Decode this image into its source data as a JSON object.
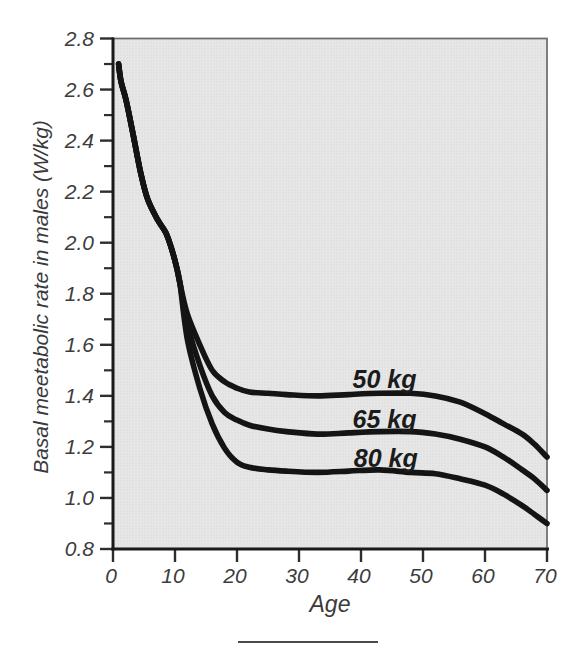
{
  "figure": {
    "background": "#ffffff",
    "caption_rule_color": "#4a4a4a"
  },
  "chart_data": {
    "type": "line",
    "title": "",
    "xlabel": "Age",
    "ylabel": "Basal meetabolic rate in males (W/kg)",
    "xlim": [
      0,
      70
    ],
    "ylim": [
      0.8,
      2.8
    ],
    "grid": false,
    "legend_position": "inline-curve-labels",
    "plot_bg": "#e7e7e7",
    "plot_dot_color": "#d7d7d7",
    "border_color": "#6a6a6a",
    "axis_color": "#1a1a1a",
    "tick_color": "#2e2e2e",
    "line_color": "#141414",
    "x_ticks": [
      {
        "value": 0,
        "label": "0"
      },
      {
        "value": 10,
        "label": "10"
      },
      {
        "value": 20,
        "label": "20"
      },
      {
        "value": 30,
        "label": "30"
      },
      {
        "value": 40,
        "label": "40"
      },
      {
        "value": 50,
        "label": "50"
      },
      {
        "value": 60,
        "label": "60"
      },
      {
        "value": 70,
        "label": "70"
      }
    ],
    "y_ticks_major": [
      {
        "value": 2.8,
        "label": "2.8"
      },
      {
        "value": 2.6,
        "label": "2.6"
      },
      {
        "value": 2.4,
        "label": "2.4"
      },
      {
        "value": 2.2,
        "label": "2.2"
      },
      {
        "value": 2.0,
        "label": "2.0"
      },
      {
        "value": 1.8,
        "label": "1.8"
      },
      {
        "value": 1.6,
        "label": "1.6"
      },
      {
        "value": 1.4,
        "label": "1.4"
      },
      {
        "value": 1.2,
        "label": "1.2"
      },
      {
        "value": 1.0,
        "label": "1.0"
      },
      {
        "value": 0.8,
        "label": "0.8"
      }
    ],
    "y_ticks_minor": [
      2.7,
      2.5,
      2.3,
      2.1,
      1.9,
      1.7,
      1.5,
      1.3,
      1.1,
      0.9
    ],
    "series": [
      {
        "name": "50 kg",
        "label_pos": {
          "age": 43.8,
          "value": 1.465
        },
        "points": [
          [
            0.9,
            2.7
          ],
          [
            1.3,
            2.63
          ],
          [
            2.1,
            2.56
          ],
          [
            3.2,
            2.43
          ],
          [
            4.5,
            2.27
          ],
          [
            5.6,
            2.17
          ],
          [
            7.2,
            2.09
          ],
          [
            8.5,
            2.04
          ],
          [
            9.4,
            1.98
          ],
          [
            10.2,
            1.91
          ],
          [
            10.8,
            1.84
          ],
          [
            12,
            1.72
          ],
          [
            14,
            1.6
          ],
          [
            16,
            1.5
          ],
          [
            18,
            1.455
          ],
          [
            20,
            1.43
          ],
          [
            22,
            1.415
          ],
          [
            25,
            1.41
          ],
          [
            28,
            1.405
          ],
          [
            33,
            1.4
          ],
          [
            38,
            1.405
          ],
          [
            43,
            1.41
          ],
          [
            48,
            1.41
          ],
          [
            52,
            1.4
          ],
          [
            56,
            1.375
          ],
          [
            60,
            1.33
          ],
          [
            63,
            1.29
          ],
          [
            66,
            1.25
          ],
          [
            68,
            1.21
          ],
          [
            70,
            1.16
          ]
        ]
      },
      {
        "name": "65 kg",
        "label_pos": {
          "age": 43.8,
          "value": 1.31
        },
        "points": [
          [
            0.9,
            2.7
          ],
          [
            1.3,
            2.63
          ],
          [
            2.1,
            2.56
          ],
          [
            3.2,
            2.43
          ],
          [
            4.5,
            2.27
          ],
          [
            5.6,
            2.17
          ],
          [
            7.2,
            2.09
          ],
          [
            8.5,
            2.04
          ],
          [
            9.4,
            1.98
          ],
          [
            10.2,
            1.91
          ],
          [
            10.8,
            1.84
          ],
          [
            12,
            1.68
          ],
          [
            14,
            1.52
          ],
          [
            16,
            1.4
          ],
          [
            18,
            1.335
          ],
          [
            20,
            1.305
          ],
          [
            22,
            1.285
          ],
          [
            25,
            1.27
          ],
          [
            28,
            1.26
          ],
          [
            33,
            1.25
          ],
          [
            38,
            1.255
          ],
          [
            43,
            1.26
          ],
          [
            48,
            1.26
          ],
          [
            52,
            1.25
          ],
          [
            56,
            1.23
          ],
          [
            60,
            1.2
          ],
          [
            63,
            1.16
          ],
          [
            66,
            1.11
          ],
          [
            68,
            1.075
          ],
          [
            70,
            1.03
          ]
        ]
      },
      {
        "name": "80 kg",
        "label_pos": {
          "age": 44.0,
          "value": 1.155
        },
        "points": [
          [
            0.9,
            2.7
          ],
          [
            1.3,
            2.63
          ],
          [
            2.1,
            2.56
          ],
          [
            3.2,
            2.43
          ],
          [
            4.5,
            2.27
          ],
          [
            5.6,
            2.17
          ],
          [
            7.2,
            2.09
          ],
          [
            8.5,
            2.04
          ],
          [
            9.4,
            1.98
          ],
          [
            10.2,
            1.91
          ],
          [
            10.8,
            1.84
          ],
          [
            12,
            1.62
          ],
          [
            14,
            1.43
          ],
          [
            16,
            1.29
          ],
          [
            18,
            1.195
          ],
          [
            20,
            1.14
          ],
          [
            22,
            1.12
          ],
          [
            25,
            1.11
          ],
          [
            28,
            1.105
          ],
          [
            33,
            1.1
          ],
          [
            38,
            1.105
          ],
          [
            43,
            1.11
          ],
          [
            48,
            1.1
          ],
          [
            52,
            1.095
          ],
          [
            56,
            1.075
          ],
          [
            60,
            1.05
          ],
          [
            63,
            1.015
          ],
          [
            66,
            0.97
          ],
          [
            68,
            0.935
          ],
          [
            70,
            0.9
          ]
        ]
      }
    ]
  }
}
